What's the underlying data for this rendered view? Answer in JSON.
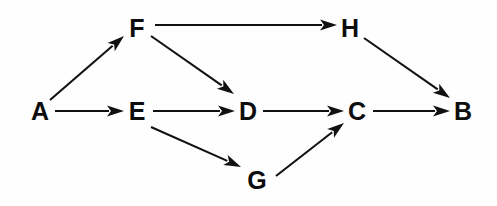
{
  "figure": {
    "kind": "directed-graph",
    "background_color": "#fefefe",
    "ink_color": "#111111",
    "width": 497,
    "height": 206
  },
  "graph": {
    "directed": true,
    "node_count": 8,
    "edge_count": 9,
    "nodes": [
      {
        "id": "A",
        "label": "A",
        "x": 40,
        "y": 111
      },
      {
        "id": "F",
        "label": "F",
        "x": 137,
        "y": 28
      },
      {
        "id": "E",
        "label": "E",
        "x": 137,
        "y": 111
      },
      {
        "id": "D",
        "label": "D",
        "x": 248,
        "y": 111
      },
      {
        "id": "G",
        "label": "G",
        "x": 257,
        "y": 180
      },
      {
        "id": "H",
        "label": "H",
        "x": 350,
        "y": 28
      },
      {
        "id": "C",
        "label": "C",
        "x": 357,
        "y": 111
      },
      {
        "id": "B",
        "label": "B",
        "x": 463,
        "y": 111
      }
    ],
    "edges": [
      {
        "from": "A",
        "to": "F",
        "x1": 50,
        "y1": 100,
        "x2": 124,
        "y2": 36
      },
      {
        "from": "A",
        "to": "E",
        "x1": 55,
        "y1": 111,
        "x2": 124,
        "y2": 111
      },
      {
        "from": "F",
        "to": "H",
        "x1": 155,
        "y1": 25,
        "x2": 337,
        "y2": 25
      },
      {
        "from": "F",
        "to": "D",
        "x1": 151,
        "y1": 36,
        "x2": 234,
        "y2": 94
      },
      {
        "from": "E",
        "to": "D",
        "x1": 153,
        "y1": 111,
        "x2": 235,
        "y2": 111
      },
      {
        "from": "E",
        "to": "G",
        "x1": 151,
        "y1": 127,
        "x2": 241,
        "y2": 167
      },
      {
        "from": "D",
        "to": "C",
        "x1": 263,
        "y1": 111,
        "x2": 344,
        "y2": 111
      },
      {
        "from": "G",
        "to": "C",
        "x1": 276,
        "y1": 176,
        "x2": 344,
        "y2": 123
      },
      {
        "from": "H",
        "to": "B",
        "x1": 364,
        "y1": 38,
        "x2": 450,
        "y2": 98
      },
      {
        "from": "C",
        "to": "B",
        "x1": 373,
        "y1": 111,
        "x2": 450,
        "y2": 111
      }
    ]
  }
}
